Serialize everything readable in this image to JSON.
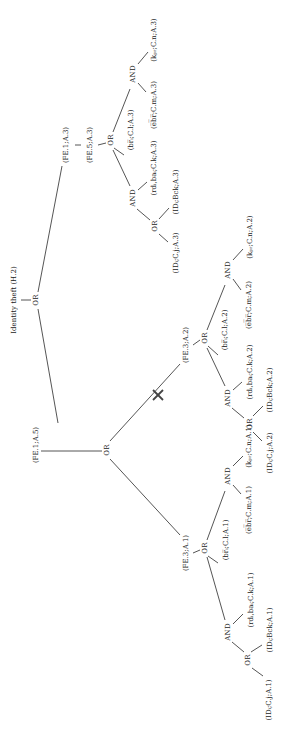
{
  "diagram": {
    "rotation_deg": -90,
    "colors": {
      "line": "#2a2a2a",
      "text": "#1a1a1a",
      "background": "#ffffff",
      "cut_mark": "#444444"
    },
    "nodes": [
      {
        "id": "root",
        "label": "Identity theft (H.2)",
        "type": "goal",
        "x": 14,
        "y": 300
      },
      {
        "id": "or0",
        "label": "OR",
        "type": "gate",
        "x": 36,
        "y": 300
      },
      {
        "id": "fe1a3",
        "label": "(FE.1;A.3)",
        "type": "leaf",
        "x": 66,
        "y": 145
      },
      {
        "id": "fe5a3",
        "label": "(FE.5;A.3)",
        "type": "leaf",
        "x": 90,
        "y": 145
      },
      {
        "id": "or3",
        "label": "OR",
        "type": "gate",
        "x": 111,
        "y": 140
      },
      {
        "id": "br3",
        "label": "(br̅ᵢ;C.l;A.3)",
        "type": "leaf",
        "x": 131,
        "y": 130
      },
      {
        "id": "and3a",
        "label": "AND",
        "type": "gate",
        "x": 133,
        "y": 74
      },
      {
        "id": "ebr3",
        "label": "(e̅b̅r̅;C.m;A.3)",
        "type": "leaf",
        "x": 154,
        "y": 105
      },
      {
        "id": "k3",
        "label": "(kₚᵣ;C.n;A.3)",
        "type": "leaf",
        "x": 154,
        "y": 40
      },
      {
        "id": "and3b",
        "label": "AND",
        "type": "gate",
        "x": 133,
        "y": 198
      },
      {
        "id": "rdba3",
        "label": "(rdᵢ,baᵢ;C.k;A.3)",
        "type": "leaf",
        "x": 154,
        "y": 168
      },
      {
        "id": "or3b",
        "label": "OR",
        "type": "gate",
        "x": 155,
        "y": 226
      },
      {
        "id": "idb3",
        "label": "(IDᵢ;Bck;A.3)",
        "type": "leaf",
        "x": 176,
        "y": 192
      },
      {
        "id": "idc3",
        "label": "(IDᵢ;C.j;A.3)",
        "type": "leaf",
        "x": 176,
        "y": 253
      },
      {
        "id": "fe1a5",
        "label": "(FE.1;A.5)",
        "type": "leaf",
        "x": 36,
        "y": 445
      },
      {
        "id": "or5",
        "label": "OR",
        "type": "gate",
        "x": 107,
        "y": 450
      },
      {
        "id": "fe3a2",
        "label": "(FE.3;A.2)",
        "type": "leaf",
        "x": 186,
        "y": 345
      },
      {
        "id": "or2",
        "label": "OR",
        "type": "gate",
        "x": 205,
        "y": 338
      },
      {
        "id": "br2",
        "label": "(br̅ᵢ;C.l;A.2)",
        "type": "leaf",
        "x": 225,
        "y": 330
      },
      {
        "id": "and2a",
        "label": "AND",
        "type": "gate",
        "x": 228,
        "y": 270
      },
      {
        "id": "ebr2",
        "label": "(e̅b̅r̅;C.m;A.2)",
        "type": "leaf",
        "x": 249,
        "y": 305
      },
      {
        "id": "k2",
        "label": "(kₚᵣ;C.n;A.2)",
        "type": "leaf",
        "x": 250,
        "y": 237
      },
      {
        "id": "and2b",
        "label": "AND",
        "type": "gate",
        "x": 228,
        "y": 398
      },
      {
        "id": "rdba2",
        "label": "(rdᵢ,baᵢ;C.k;A.2)",
        "type": "leaf",
        "x": 250,
        "y": 372
      },
      {
        "id": "or2b",
        "label": "OR",
        "type": "gate",
        "x": 250,
        "y": 424
      },
      {
        "id": "idb2",
        "label": "(IDᵢ;Bck;A.2)",
        "type": "leaf",
        "x": 270,
        "y": 390
      },
      {
        "id": "idc2",
        "label": "(IDᵢ;C.j;A.2)",
        "type": "leaf",
        "x": 270,
        "y": 453
      },
      {
        "id": "fe3a1",
        "label": "(FE.3;A.1)",
        "type": "leaf",
        "x": 186,
        "y": 553
      },
      {
        "id": "or1",
        "label": "OR",
        "type": "gate",
        "x": 205,
        "y": 548
      },
      {
        "id": "br1",
        "label": "(br̅ᵢ;C.l;A.1)",
        "type": "leaf",
        "x": 226,
        "y": 540
      },
      {
        "id": "and1a",
        "label": "AND",
        "type": "gate",
        "x": 228,
        "y": 476
      },
      {
        "id": "ebr1",
        "label": "(e̅b̅r̅;C.m;A.1)",
        "type": "leaf",
        "x": 249,
        "y": 510
      },
      {
        "id": "k1",
        "label": "(kₚᵣ;C.n;A.1)",
        "type": "leaf",
        "x": 249,
        "y": 446
      },
      {
        "id": "and1b",
        "label": "AND",
        "type": "gate",
        "x": 228,
        "y": 632
      },
      {
        "id": "rdba1",
        "label": "(rdᵢ,baᵢ;C.k;A.1)",
        "type": "leaf",
        "x": 251,
        "y": 600
      },
      {
        "id": "or1b",
        "label": "OR",
        "type": "gate",
        "x": 248,
        "y": 660
      },
      {
        "id": "idb1",
        "label": "(IDᵢ;Bck;A.1)",
        "type": "leaf",
        "x": 270,
        "y": 630
      },
      {
        "id": "idc1",
        "label": "(IDᵢ;C.j;A.1)",
        "type": "leaf",
        "x": 269,
        "y": 700
      }
    ],
    "edges": [
      {
        "from": "root",
        "to": "or0",
        "x1": 21,
        "y1": 300,
        "x2": 31,
        "y2": 300
      },
      {
        "from": "or0",
        "to": "fe1a3",
        "x1": 38,
        "y1": 292,
        "x2": 62,
        "y2": 166
      },
      {
        "from": "or0",
        "to": "fe1a5",
        "x1": 38,
        "y1": 309,
        "x2": 58,
        "y2": 423
      },
      {
        "from": "fe1a3",
        "to": "fe5a3",
        "x1": 75,
        "y1": 145,
        "x2": 81,
        "y2": 145
      },
      {
        "from": "fe5a3",
        "to": "or3",
        "x1": 98,
        "y1": 145,
        "x2": 106,
        "y2": 143
      },
      {
        "from": "or3",
        "to": "and3a",
        "x1": 113,
        "y1": 132,
        "x2": 130,
        "y2": 89
      },
      {
        "from": "or3",
        "to": "br3",
        "x1": 114,
        "y1": 148,
        "x2": 124,
        "y2": 155
      },
      {
        "from": "or3",
        "to": "and3b",
        "x1": 113,
        "y1": 150,
        "x2": 130,
        "y2": 186
      },
      {
        "from": "and3a",
        "to": "ebr3",
        "x1": 138,
        "y1": 83,
        "x2": 146,
        "y2": 92
      },
      {
        "from": "and3a",
        "to": "k3",
        "x1": 138,
        "y1": 64,
        "x2": 148,
        "y2": 52
      },
      {
        "from": "and3b",
        "to": "rdba3",
        "x1": 138,
        "y1": 190,
        "x2": 147,
        "y2": 182
      },
      {
        "from": "and3b",
        "to": "or3b",
        "x1": 137,
        "y1": 209,
        "x2": 150,
        "y2": 220
      },
      {
        "from": "or3b",
        "to": "idb3",
        "x1": 159,
        "y1": 219,
        "x2": 169,
        "y2": 208
      },
      {
        "from": "or3b",
        "to": "idc3",
        "x1": 159,
        "y1": 234,
        "x2": 168,
        "y2": 242
      },
      {
        "from": "fe1a5",
        "to": "or5",
        "x1": 41,
        "y1": 451,
        "x2": 102,
        "y2": 451
      },
      {
        "from": "or5",
        "to": "fe3a2",
        "x1": 110,
        "y1": 441,
        "x2": 180,
        "y2": 364
      },
      {
        "from": "or5",
        "to": "fe3a1",
        "x1": 110,
        "y1": 459,
        "x2": 180,
        "y2": 535
      },
      {
        "from": "fe3a2",
        "to": "or2",
        "x1": 193,
        "y1": 345,
        "x2": 200,
        "y2": 340
      },
      {
        "from": "or2",
        "to": "and2a",
        "x1": 207,
        "y1": 330,
        "x2": 225,
        "y2": 285
      },
      {
        "from": "or2",
        "to": "br2",
        "x1": 208,
        "y1": 346,
        "x2": 218,
        "y2": 355
      },
      {
        "from": "or2",
        "to": "and2b",
        "x1": 207,
        "y1": 348,
        "x2": 225,
        "y2": 386
      },
      {
        "from": "and2a",
        "to": "ebr2",
        "x1": 233,
        "y1": 279,
        "x2": 241,
        "y2": 290
      },
      {
        "from": "and2a",
        "to": "k2",
        "x1": 233,
        "y1": 260,
        "x2": 243,
        "y2": 249
      },
      {
        "from": "and2b",
        "to": "rdba2",
        "x1": 233,
        "y1": 390,
        "x2": 242,
        "y2": 382
      },
      {
        "from": "and2b",
        "to": "or2b",
        "x1": 232,
        "y1": 408,
        "x2": 244,
        "y2": 418
      },
      {
        "from": "or2b",
        "to": "idb2",
        "x1": 253,
        "y1": 416,
        "x2": 263,
        "y2": 406
      },
      {
        "from": "or2b",
        "to": "idc2",
        "x1": 253,
        "y1": 432,
        "x2": 262,
        "y2": 441
      },
      {
        "from": "fe3a1",
        "to": "or1",
        "x1": 193,
        "y1": 553,
        "x2": 200,
        "y2": 550
      },
      {
        "from": "or1",
        "to": "and1a",
        "x1": 207,
        "y1": 540,
        "x2": 225,
        "y2": 491
      },
      {
        "from": "or1",
        "to": "br1",
        "x1": 208,
        "y1": 556,
        "x2": 218,
        "y2": 563
      },
      {
        "from": "or1",
        "to": "and1b",
        "x1": 207,
        "y1": 557,
        "x2": 225,
        "y2": 620
      },
      {
        "from": "and1a",
        "to": "ebr1",
        "x1": 233,
        "y1": 485,
        "x2": 241,
        "y2": 494
      },
      {
        "from": "and1a",
        "to": "k1",
        "x1": 233,
        "y1": 466,
        "x2": 243,
        "y2": 456
      },
      {
        "from": "and1b",
        "to": "rdba1",
        "x1": 233,
        "y1": 624,
        "x2": 243,
        "y2": 614
      },
      {
        "from": "and1b",
        "to": "or1b",
        "x1": 232,
        "y1": 642,
        "x2": 244,
        "y2": 652
      },
      {
        "from": "or1b",
        "to": "idb1",
        "x1": 251,
        "y1": 652,
        "x2": 262,
        "y2": 645
      },
      {
        "from": "or1b",
        "to": "idc1",
        "x1": 252,
        "y1": 668,
        "x2": 263,
        "y2": 676
      }
    ],
    "cut_marks": [
      {
        "id": "pruned-fe3a2",
        "x": 158,
        "y": 395,
        "size": 5
      }
    ]
  }
}
